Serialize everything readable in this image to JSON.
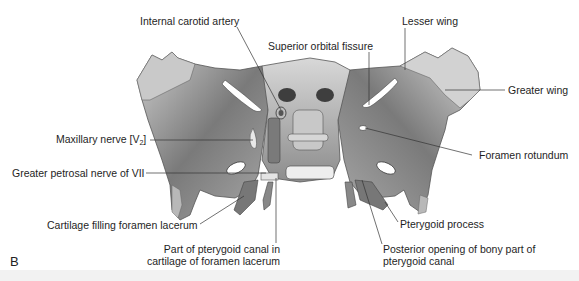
{
  "figure": {
    "panel_letter": "B"
  },
  "labels": {
    "internal_carotid_artery": "Internal carotid artery",
    "superior_orbital_fissure": "Superior orbital fissure",
    "lesser_wing": "Lesser wing",
    "greater_wing": "Greater wing",
    "maxillary_nerve": "Maxillary nerve [V",
    "maxillary_nerve_sub": "2",
    "maxillary_nerve_end": "]",
    "greater_petrosal_nerve": "Greater petrosal nerve of VII",
    "foramen_rotundum": "Foramen rotundum",
    "cartilage_filling": "Cartilage filling foramen lacerum",
    "pterygoid_process": "Pterygoid process",
    "part_pterygoid_canal_1": "Part of pterygoid canal in",
    "part_pterygoid_canal_2": "cartilage of foramen lacerum",
    "posterior_opening_1": "Posterior opening of bony part of",
    "posterior_opening_2": "pterygoid canal"
  },
  "colors": {
    "bone_light": "#e6e6e6",
    "bone_mid": "#9a9a9a",
    "bone_dark": "#4a4a4a",
    "leader": "#333333"
  }
}
